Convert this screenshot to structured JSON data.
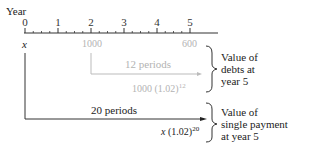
{
  "timeline": {
    "axis_label": "Year",
    "ticks": [
      "0",
      "1",
      "2",
      "3",
      "4",
      "5"
    ]
  },
  "debts": {
    "payment_year2": "1000",
    "payment_year5": "600",
    "periods_label": "12 periods",
    "future_value_base": "1000 (1.02)",
    "future_value_exp": "12",
    "brace_label_line1": "Value of",
    "brace_label_line2": "debts at",
    "brace_label_line3": "year 5"
  },
  "single_payment": {
    "variable": "x",
    "periods_label": "20 periods",
    "future_value_var": "x",
    "future_value_base": " (1.02)",
    "future_value_exp": "20",
    "brace_label_line1": "Value of",
    "brace_label_line2": "single payment",
    "brace_label_line3": "at year 5"
  },
  "colors": {
    "primary_line": "#333333",
    "secondary_line": "#bbbbbb"
  }
}
